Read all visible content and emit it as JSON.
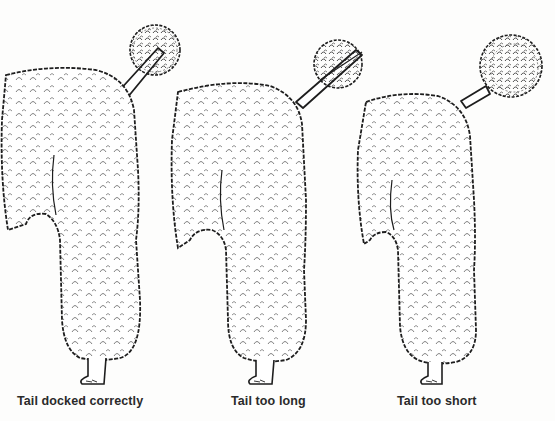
{
  "figure": {
    "panels": [
      {
        "id": "correct",
        "caption": "Tail docked correctly",
        "tail": "medium tail, pompom at top"
      },
      {
        "id": "long",
        "caption": "Tail too long",
        "tail": "long tail, pompom extended far"
      },
      {
        "id": "short",
        "caption": "Tail too short",
        "tail": "short stub, pompom close to body"
      }
    ]
  },
  "colors": {
    "background": "#fdfdfc",
    "ink": "#1e1e1e",
    "caption": "#2a2a2a"
  }
}
